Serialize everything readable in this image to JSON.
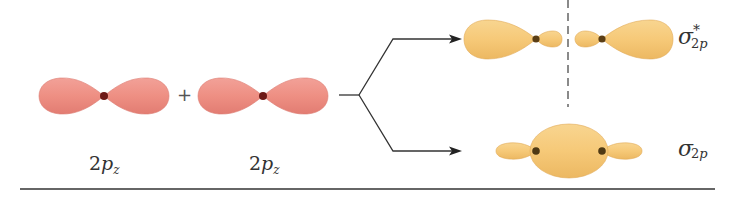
{
  "diagram": {
    "atomic_orbitals": [
      {
        "id": "ao-left",
        "label_main": "2",
        "label_italic": "p",
        "label_sub": "z",
        "color": "#ee8f83"
      },
      {
        "id": "ao-right",
        "label_main": "2",
        "label_italic": "p",
        "label_sub": "z",
        "color": "#ee8f83"
      }
    ],
    "operator": "+",
    "molecular_orbitals": [
      {
        "id": "sigma-star-2p",
        "name": "antibonding",
        "symbol": "σ",
        "superscript": "*",
        "sub_num": "2",
        "sub_italic": "p",
        "color": "#f6c978",
        "has_node": true
      },
      {
        "id": "sigma-2p",
        "name": "bonding",
        "symbol": "σ",
        "superscript": "",
        "sub_num": "2",
        "sub_italic": "p",
        "color": "#f6c978",
        "has_node": false
      }
    ],
    "colors": {
      "ao_fill": "#ee8f83",
      "ao_edge": "#d9706a",
      "mo_fill": "#f6c978",
      "mo_edge": "#e2ad58",
      "nucleus_ao": "#7a1e1a",
      "nucleus_mo": "#5a3e16",
      "line": "#333333",
      "node_line": "#8a8a8a"
    }
  }
}
